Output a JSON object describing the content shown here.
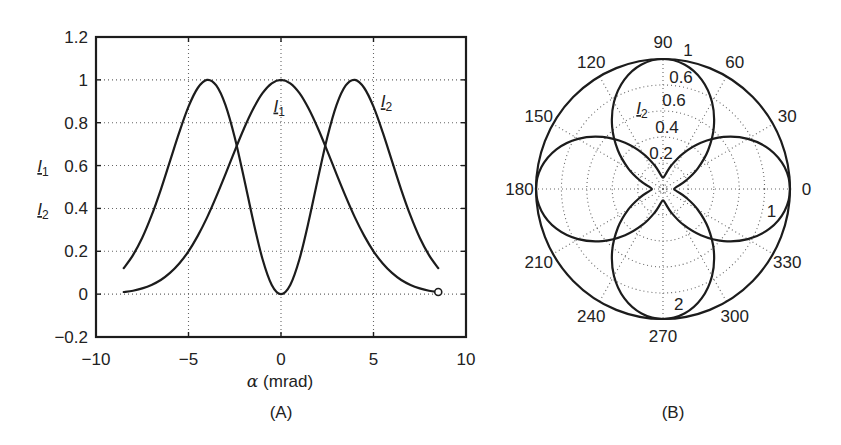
{
  "figure": {
    "panel_captions": [
      "(A)",
      "(B)"
    ]
  },
  "chart_data": [
    {
      "type": "line",
      "panel": "A",
      "caption": "(A)",
      "title": "",
      "xlabel": {
        "symbol": "α",
        "unit": " (mrad)"
      },
      "ylabel": [
        {
          "symbol": "I",
          "sub": "1"
        },
        {
          "symbol": "I",
          "sub": "2"
        }
      ],
      "xlim": [
        -10,
        10
      ],
      "ylim": [
        -0.2,
        1.2
      ],
      "xticks": [
        -10,
        -5,
        0,
        5,
        10
      ],
      "xtick_labels": [
        "−10",
        "−5",
        "0",
        "5",
        "10"
      ],
      "yticks": [
        -0.2,
        0,
        0.2,
        0.4,
        0.6,
        0.8,
        1,
        1.2
      ],
      "ytick_labels": [
        "−0.2",
        "0",
        "0.2",
        "0.4",
        "0.6",
        "0.8",
        "1",
        "1.2"
      ],
      "grid": true,
      "legend": "none (inline curve labels)",
      "x": [
        -8.5,
        -8,
        -7.5,
        -7,
        -6.5,
        -6,
        -5.5,
        -5,
        -4.5,
        -4,
        -3.5,
        -3,
        -2.5,
        -2,
        -1.5,
        -1,
        -0.5,
        0,
        0.5,
        1,
        1.5,
        2,
        2.5,
        3,
        3.5,
        4,
        4.5,
        5,
        5.5,
        6,
        6.5,
        7,
        7.5,
        8,
        8.5
      ],
      "series": [
        {
          "name": "I1",
          "values": [
            0.01,
            0.016,
            0.027,
            0.043,
            0.066,
            0.099,
            0.143,
            0.2,
            0.272,
            0.357,
            0.455,
            0.56,
            0.669,
            0.773,
            0.865,
            0.938,
            0.984,
            1.0,
            0.984,
            0.938,
            0.865,
            0.773,
            0.669,
            0.56,
            0.455,
            0.357,
            0.272,
            0.2,
            0.143,
            0.099,
            0.066,
            0.043,
            0.027,
            0.016,
            0.01
          ],
          "end_marker": "open-circle"
        },
        {
          "name": "I2",
          "values": [
            0.121,
            0.182,
            0.263,
            0.366,
            0.487,
            0.621,
            0.755,
            0.875,
            0.962,
            1.0,
            0.974,
            0.882,
            0.731,
            0.541,
            0.341,
            0.164,
            0.043,
            0.0,
            0.043,
            0.164,
            0.341,
            0.541,
            0.731,
            0.882,
            0.974,
            1.0,
            0.962,
            0.875,
            0.755,
            0.621,
            0.487,
            0.366,
            0.263,
            0.182,
            0.121
          ]
        }
      ],
      "annotations": [
        {
          "symbol": "I",
          "sub": "1",
          "x": -0.1,
          "y": 0.88
        },
        {
          "symbol": "I",
          "sub": "2",
          "x": 5.7,
          "y": 0.9
        }
      ]
    },
    {
      "type": "polar",
      "panel": "B",
      "caption": "(B)",
      "title": "",
      "rlim": [
        0,
        1
      ],
      "rings": [
        0.2,
        0.4,
        0.6,
        0.8,
        1.0
      ],
      "r_tick_labels": [
        "0.2",
        "0.4",
        "0.6",
        "0.6",
        "1"
      ],
      "rlabel": {
        "symbol": "I",
        "sub": "2"
      },
      "theta_ticks_deg": [
        0,
        30,
        60,
        90,
        120,
        150,
        180,
        210,
        240,
        270,
        300,
        330
      ],
      "theta_tick_labels": [
        "0",
        "30",
        "60",
        "90",
        "120",
        "150",
        "180",
        "210",
        "240",
        "270",
        "300",
        "330"
      ],
      "grid": true,
      "theta_deg": [
        0,
        10,
        20,
        30,
        40,
        50,
        60,
        70,
        80,
        90,
        100,
        110,
        120,
        130,
        140,
        150,
        160,
        170,
        180,
        190,
        200,
        210,
        220,
        230,
        240,
        250,
        260,
        270,
        280,
        290,
        300,
        310,
        320,
        330,
        340,
        350,
        360
      ],
      "series": [
        {
          "name": "1",
          "label": "1",
          "label_pos": {
            "theta": 349,
            "r": 0.87
          },
          "values": [
            1.0,
            0.972,
            0.893,
            0.772,
            0.623,
            0.464,
            0.315,
            0.194,
            0.115,
            0.087,
            0.115,
            0.194,
            0.315,
            0.464,
            0.623,
            0.772,
            0.893,
            0.972,
            1.0,
            0.972,
            0.893,
            0.772,
            0.623,
            0.464,
            0.315,
            0.194,
            0.115,
            0.087,
            0.115,
            0.194,
            0.315,
            0.464,
            0.623,
            0.772,
            0.893,
            0.972,
            1.0
          ]
        },
        {
          "name": "2",
          "label": "2",
          "label_pos": {
            "theta": 278,
            "r": 0.89
          },
          "values": [
            0.087,
            0.115,
            0.194,
            0.315,
            0.464,
            0.623,
            0.772,
            0.893,
            0.972,
            1.0,
            0.972,
            0.893,
            0.772,
            0.623,
            0.464,
            0.315,
            0.194,
            0.115,
            0.087,
            0.115,
            0.194,
            0.315,
            0.464,
            0.623,
            0.772,
            0.893,
            0.972,
            1.0,
            0.972,
            0.893,
            0.772,
            0.623,
            0.464,
            0.315,
            0.194,
            0.115,
            0.087
          ]
        }
      ]
    }
  ]
}
